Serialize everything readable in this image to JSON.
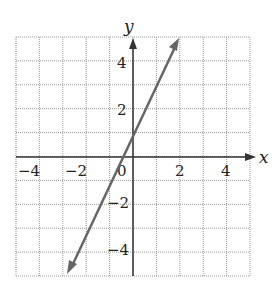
{
  "chart_data": {
    "type": "line",
    "title": "",
    "xlabel": "x",
    "ylabel": "y",
    "xlim": [
      -5,
      5
    ],
    "ylim": [
      -5,
      5
    ],
    "grid": true,
    "xticks": [
      "-4",
      "-2",
      "0",
      "2",
      "4"
    ],
    "yticks": [
      "4",
      "2",
      "-2",
      "-4"
    ],
    "series": [
      {
        "name": "y = 2x + 1",
        "x": [
          -3,
          2
        ],
        "y": [
          -5,
          5
        ],
        "arrows": "both",
        "color": "#666666"
      }
    ]
  },
  "labels": {
    "x": "x",
    "y": "y",
    "xt": [
      "−4",
      "−2",
      "0",
      "2",
      "4"
    ],
    "yt": [
      "4",
      "2",
      "−2",
      "−4"
    ]
  }
}
